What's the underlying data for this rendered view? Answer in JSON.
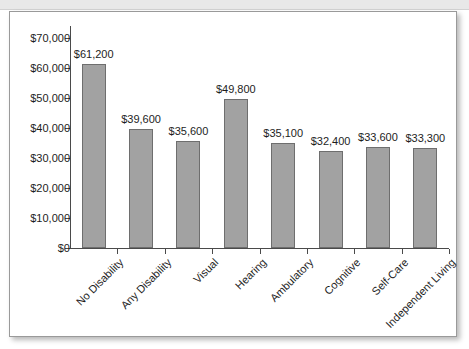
{
  "chart_data": {
    "type": "bar",
    "title": "",
    "subtitle": "",
    "xlabel": "",
    "ylabel": "",
    "categories": [
      "No Disability",
      "Any Disability",
      "Visual",
      "Hearing",
      "Ambulatory",
      "Cognitive",
      "Self-Care",
      "Independent Living"
    ],
    "values": [
      61200,
      39600,
      35600,
      49800,
      35100,
      32400,
      33600,
      33300
    ],
    "data_labels": [
      "$61,200",
      "$39,600",
      "$35,600",
      "$49,800",
      "$35,100",
      "$32,400",
      "$33,600",
      "$33,300"
    ],
    "ylim": [
      0,
      70000
    ],
    "ytick_values": [
      0,
      10000,
      20000,
      30000,
      40000,
      50000,
      60000,
      70000
    ],
    "ytick_labels": [
      "$0",
      "$10,000",
      "$20,000",
      "$30,000",
      "$40,000",
      "$50,000",
      "$60,000",
      "$70,000"
    ],
    "grid": false,
    "legend": false,
    "legend_position": "none",
    "bar_color": "#a2a2a2",
    "bar_edge_color": "#6e6e6e",
    "axis_color": "#4a4a4a",
    "text_color": "#1d1d1d",
    "background_color": "#ffffff",
    "xtick_label_rotation": -45
  }
}
